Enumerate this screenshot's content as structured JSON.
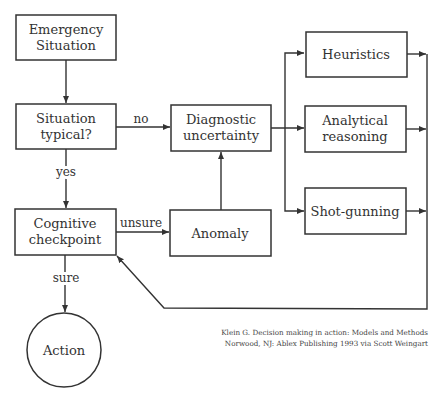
{
  "diagram": {
    "nodes": {
      "emergency": {
        "line1": "Emergency",
        "line2": "Situation"
      },
      "typical": {
        "line1": "Situation",
        "line2": "typical?"
      },
      "diagnostic": {
        "line1": "Diagnostic",
        "line2": "uncertainty"
      },
      "heuristics": {
        "label": "Heuristics"
      },
      "analytical": {
        "line1": "Analytical",
        "line2": "reasoning"
      },
      "shotgunning": {
        "label": "Shot-gunning"
      },
      "checkpoint": {
        "line1": "Cognitive",
        "line2": "checkpoint"
      },
      "anomaly": {
        "label": "Anomaly"
      },
      "action": {
        "label": "Action"
      }
    },
    "edges": {
      "no": "no",
      "yes": "yes",
      "unsure": "unsure",
      "sure": "sure"
    },
    "citation": {
      "line1": "Klein G. Decision making in action: Models and Methods",
      "line2": "Norwood, NJ: Ablex Publishing 1993 via Scott Weingart"
    }
  }
}
